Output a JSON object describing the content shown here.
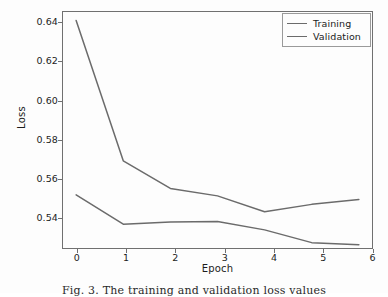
{
  "figure": {
    "caption": "Fig. 3. The training and validation loss values"
  },
  "axis": {
    "xlabel": "Epoch",
    "ylabel": "Loss",
    "yticks": [
      "0.54",
      "0.56",
      "0.58",
      "0.60",
      "0.62",
      "0.64"
    ],
    "xticks": [
      "0",
      "1",
      "2",
      "3",
      "4",
      "5",
      "6"
    ]
  },
  "legend": {
    "entries": [
      {
        "label": "Training",
        "color": "#6b6b6b"
      },
      {
        "label": "Validation",
        "color": "#6b6b6b"
      }
    ]
  },
  "chart_data": {
    "type": "line",
    "title": "",
    "xlabel": "Epoch",
    "ylabel": "Loss",
    "x": [
      0,
      1,
      2,
      3,
      4,
      5,
      6
    ],
    "xlim": [
      -0.3,
      6.3
    ],
    "ylim": [
      0.5305,
      0.6425
    ],
    "grid": false,
    "legend_position": "upper right",
    "series": [
      {
        "name": "Training",
        "color": "#6b6b6b",
        "values": [
          0.638,
          0.572,
          0.559,
          0.5555,
          0.548,
          0.5515,
          0.5538
        ]
      },
      {
        "name": "Validation",
        "color": "#6b6b6b",
        "values": [
          0.556,
          0.5422,
          0.5432,
          0.5434,
          0.5395,
          0.5335,
          0.5325
        ]
      }
    ]
  }
}
